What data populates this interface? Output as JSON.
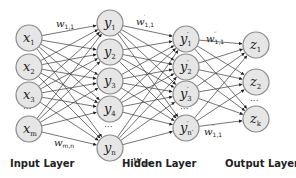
{
  "diagram": {
    "type": "neural-network",
    "layers": [
      {
        "id": "input",
        "label": "Input Layer",
        "cx": 29,
        "nodes": [
          {
            "base": "x",
            "sub": "1",
            "prime": "",
            "cy": 38
          },
          {
            "base": "x",
            "sub": "2",
            "prime": "",
            "cy": 67
          },
          {
            "base": "x",
            "sub": "3",
            "prime": "",
            "cy": 95
          },
          {
            "base": "x",
            "sub": "m",
            "prime": "",
            "cy": 129
          }
        ],
        "ellipsis_y": 112
      },
      {
        "id": "hidden1",
        "label": "Hidden Layer",
        "cx": 110,
        "nodes": [
          {
            "base": "y",
            "sub": "1",
            "prime": "",
            "cy": 23
          },
          {
            "base": "y",
            "sub": "2",
            "prime": "",
            "cy": 52
          },
          {
            "base": "y",
            "sub": "3",
            "prime": "",
            "cy": 81
          },
          {
            "base": "y",
            "sub": "4",
            "prime": "",
            "cy": 109
          },
          {
            "base": "y",
            "sub": "n",
            "prime": "",
            "cy": 148
          }
        ],
        "ellipsis_y": 130
      },
      {
        "id": "hidden2",
        "label": "",
        "cx": 186,
        "nodes": [
          {
            "base": "y",
            "sub": "1",
            "prime": "′",
            "cy": 39
          },
          {
            "base": "y",
            "sub": "2",
            "prime": "′",
            "cy": 67
          },
          {
            "base": "y",
            "sub": "3",
            "prime": "′",
            "cy": 94
          },
          {
            "base": "y",
            "sub": "n′",
            "prime": "′",
            "cy": 128
          }
        ],
        "ellipsis_y": 112
      },
      {
        "id": "output",
        "label": "Output Layer",
        "cx": 256,
        "nodes": [
          {
            "base": "z",
            "sub": "1",
            "prime": "",
            "cy": 45
          },
          {
            "base": "z",
            "sub": "2",
            "prime": "",
            "cy": 82
          },
          {
            "base": "z",
            "sub": "k",
            "prime": "",
            "cy": 119
          }
        ],
        "ellipsis_y": 104
      }
    ],
    "weights": [
      {
        "base": "w",
        "sub": "1,1",
        "sup": "",
        "x": 56,
        "y": 27
      },
      {
        "base": "w",
        "sub": "m,n",
        "sup": "",
        "x": 54,
        "y": 146
      },
      {
        "base": "w",
        "sub": "1,1",
        "sup": "′",
        "x": 136,
        "y": 25
      },
      {
        "base": "w",
        "sub": "n,n′",
        "sup": "′",
        "x": 133,
        "y": 163
      },
      {
        "base": "w",
        "sub": "1,1",
        "sup": "′′",
        "x": 206,
        "y": 42
      },
      {
        "base": "w",
        "sub": "1,1",
        "sup": "′′",
        "x": 204,
        "y": 135
      }
    ],
    "layer_labels": [
      {
        "text": "Input Layer",
        "x": 10,
        "y": 158
      },
      {
        "text": "Hidden Layer",
        "x": 122,
        "y": 158
      },
      {
        "text": "Output Layer",
        "x": 225,
        "y": 158
      }
    ],
    "node_radius": 13,
    "colors": {
      "node_fill": "#e6e6e6",
      "node_stroke": "#8a8a8a",
      "edge": "#3a3a3a"
    }
  }
}
